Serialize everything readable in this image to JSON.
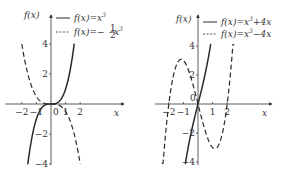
{
  "chart_data": [
    {
      "type": "line",
      "title": "",
      "xlabel": "x",
      "ylabel": "f(x)",
      "x_ticks": [
        "-2",
        "-1",
        "0",
        "1",
        "2"
      ],
      "y_ticks": [
        "4",
        "2",
        "-2",
        "-4"
      ],
      "xlim": [
        -2.2,
        2.2
      ],
      "ylim": [
        -4,
        4
      ],
      "legend_position": "upper right",
      "series": [
        {
          "name": "f(x)=x^3",
          "style": "solid",
          "expr": "x^3",
          "x_range": [
            -1.59,
            1.59
          ]
        },
        {
          "name": "f(x)=-1/2 x^3",
          "style": "dashed",
          "expr": "-0.5*x^3",
          "x_range": [
            -2.0,
            2.0
          ]
        }
      ]
    },
    {
      "type": "line",
      "title": "",
      "xlabel": "x",
      "ylabel": "f(x)",
      "x_ticks": [
        "-2",
        "-1",
        "0",
        "1",
        "2"
      ],
      "y_ticks": [
        "4",
        "2",
        "-2",
        "-4"
      ],
      "xlim": [
        -2.2,
        2.2
      ],
      "ylim": [
        -4,
        4
      ],
      "legend_position": "upper right",
      "series": [
        {
          "name": "f(x)=x^3+4x",
          "style": "solid",
          "expr": "x^3+4x",
          "x_range": [
            -0.9,
            0.9
          ]
        },
        {
          "name": "f(x)=x^3-4x",
          "style": "dashed",
          "expr": "x^3-4x",
          "x_range": [
            -2.48,
            2.48
          ]
        }
      ]
    }
  ],
  "left": {
    "ylabel": "f(x)",
    "xlabel": "x",
    "origin": "0",
    "legend": [
      {
        "prefix": "f(x)=x",
        "sup": "3",
        "suffix": ""
      },
      {
        "prefix": "f(x)=−",
        "frac_num": "1",
        "frac_den": "2",
        "mid": " x",
        "sup": "3"
      }
    ],
    "xticks": [
      "−2",
      "−1",
      "1",
      "2"
    ],
    "yticks": [
      "4",
      "2",
      "−2",
      "−4"
    ]
  },
  "right": {
    "ylabel": "f(x)",
    "xlabel": "x",
    "origin": "0",
    "legend": [
      {
        "prefix": "f(x)=x",
        "sup": "3",
        "suffix": "+4x"
      },
      {
        "prefix": "f(x)=x",
        "sup": "3",
        "suffix": "−4x"
      }
    ],
    "xticks": [
      "−2",
      "−1",
      "1",
      "2"
    ],
    "yticks": [
      "4",
      "2",
      "−2",
      "−4"
    ]
  },
  "colors": {
    "line": "#2a2a2a",
    "axis": "#333333"
  }
}
